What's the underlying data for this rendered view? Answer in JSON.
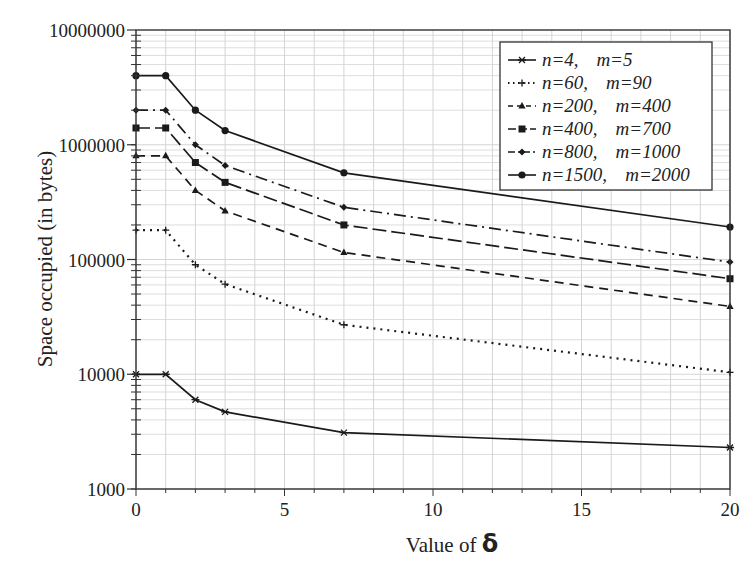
{
  "chart_data": {
    "type": "line",
    "title": "",
    "xlabel": "Value of δ",
    "ylabel": "Space occupied (in bytes)",
    "xlim": [
      0,
      20
    ],
    "ylim": [
      1000,
      10000000
    ],
    "yscale": "log",
    "grid": true,
    "legend_position": "upper right",
    "x_ticks": [
      0,
      5,
      10,
      15,
      20
    ],
    "x_tick_labels": [
      "0",
      "5",
      "10",
      "15",
      "20"
    ],
    "y_ticks": [
      1000,
      10000,
      100000,
      1000000,
      10000000
    ],
    "y_tick_labels": [
      "1000",
      "10000",
      "100000",
      "1000000",
      "10000000"
    ],
    "x": [
      0,
      1,
      2,
      3,
      7,
      20
    ],
    "series": [
      {
        "name": "n=4,   m=5",
        "marker": "x",
        "dash": "solid",
        "values": [
          10000,
          10000,
          6000,
          4700,
          3100,
          2300
        ]
      },
      {
        "name": "n=60,   m=90",
        "marker": "plus",
        "dash": "dot",
        "values": [
          180000,
          180000,
          90000,
          61000,
          27000,
          10400
        ]
      },
      {
        "name": "n=200,   m=400",
        "marker": "triangle",
        "dash": "dash",
        "values": [
          800000,
          800000,
          400000,
          265000,
          115000,
          39000
        ]
      },
      {
        "name": "n=400,   m=700",
        "marker": "square",
        "dash": "longdash",
        "values": [
          1400000,
          1400000,
          700000,
          470000,
          200000,
          68000
        ]
      },
      {
        "name": "n=800,   m=1000",
        "marker": "diamond",
        "dash": "dashdot",
        "values": [
          2000000,
          2000000,
          1000000,
          660000,
          285000,
          95000
        ]
      },
      {
        "name": "n=1500,   m=2000",
        "marker": "circle",
        "dash": "solid",
        "values": [
          4000000,
          4000000,
          2000000,
          1330000,
          570000,
          192000
        ]
      }
    ]
  },
  "axis": {
    "xlabel_text": "Value of ",
    "xlabel_symbol": "δ",
    "ylabel": "Space occupied (in bytes)"
  },
  "legend": {
    "items": [
      {
        "n": "n=4,",
        "m": "m=5"
      },
      {
        "n": "n=60,",
        "m": "m=90"
      },
      {
        "n": "n=200,",
        "m": "m=400"
      },
      {
        "n": "n=400,",
        "m": "m=700"
      },
      {
        "n": "n=800,",
        "m": "m=1000"
      },
      {
        "n": "n=1500,",
        "m": "m=2000"
      }
    ]
  },
  "colors": {
    "line": "#1a1a1a",
    "grid": "#d4d4d4",
    "axis": "#333333",
    "background": "#ffffff"
  }
}
